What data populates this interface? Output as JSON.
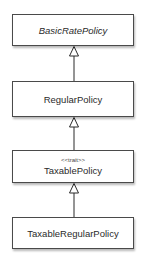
{
  "diagram": {
    "type": "uml-class-hierarchy",
    "classes": [
      {
        "id": "basic",
        "name": "BasicRatePolicy",
        "abstract": true,
        "stereotype": null
      },
      {
        "id": "regular",
        "name": "RegularPolicy",
        "abstract": false,
        "stereotype": null
      },
      {
        "id": "taxable",
        "name": "TaxablePolicy",
        "abstract": false,
        "stereotype": "<<trait>>"
      },
      {
        "id": "taxregular",
        "name": "TaxableRegularPolicy",
        "abstract": false,
        "stereotype": null
      }
    ],
    "relations": [
      {
        "from": "regular",
        "to": "basic",
        "kind": "generalization"
      },
      {
        "from": "taxable",
        "to": "regular",
        "kind": "generalization"
      },
      {
        "from": "taxregular",
        "to": "taxable",
        "kind": "generalization"
      }
    ],
    "colors": {
      "border": "#4a4a4a",
      "line": "#2a2a2a",
      "background": "#ffffff"
    }
  }
}
